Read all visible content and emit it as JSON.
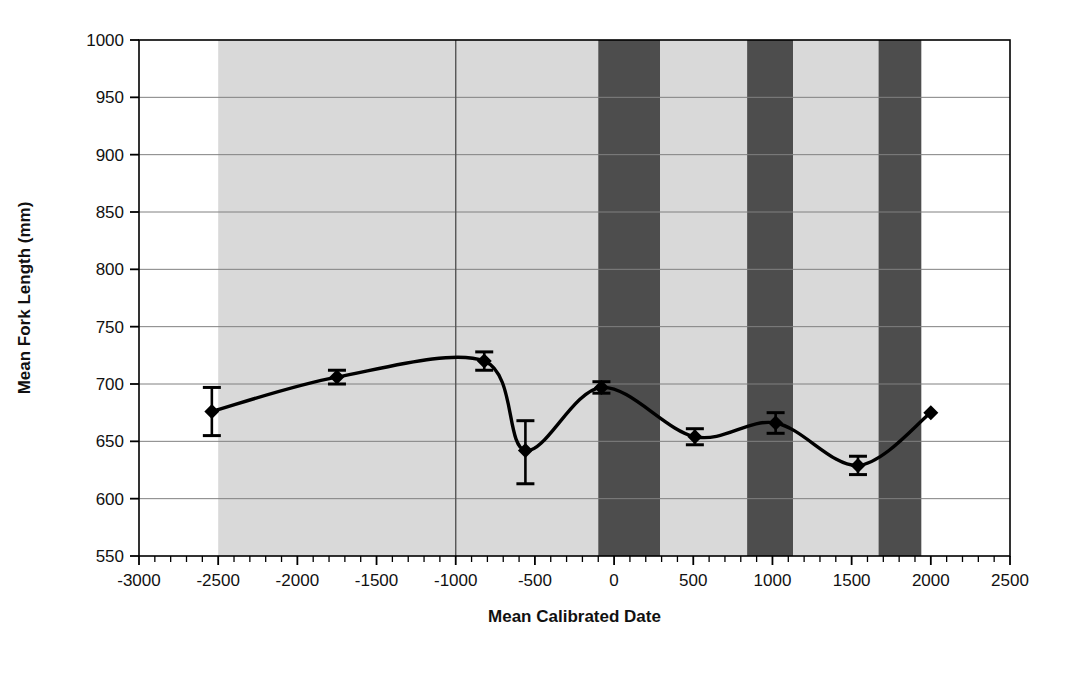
{
  "chart_data": {
    "type": "line",
    "title": "",
    "xlabel": "Mean Calibrated Date",
    "ylabel": "Mean Fork Length (mm)",
    "xlim": [
      -3000,
      2500
    ],
    "ylim": [
      550,
      1000
    ],
    "xticks": [
      -3000,
      -2500,
      -2000,
      -1500,
      -1000,
      -500,
      0,
      500,
      1000,
      1500,
      2000,
      2500
    ],
    "yticks": [
      550,
      600,
      650,
      700,
      750,
      800,
      850,
      900,
      950,
      1000
    ],
    "xtick_labels": [
      "-3000",
      "-2500",
      "-2000",
      "-1500",
      "-1000",
      "-500",
      "0",
      "500",
      "1000",
      "1500",
      "2000",
      "2500"
    ],
    "ytick_labels": [
      "550",
      "600",
      "650",
      "700",
      "750",
      "800",
      "850",
      "900",
      "950",
      "1000"
    ],
    "x_minor_tick_step": 100,
    "grid": "horizontal-major-and-one-vertical",
    "legend": "none",
    "series": [
      {
        "name": "Mean Fork Length",
        "marker": "diamond",
        "line_color": "#000000",
        "errorbars": true,
        "points": [
          {
            "x": -2540,
            "y": 676,
            "yerr_low": 655,
            "yerr_high": 697
          },
          {
            "x": -1750,
            "y": 706,
            "yerr_low": 700,
            "yerr_high": 712
          },
          {
            "x": -820,
            "y": 720,
            "yerr_low": 712,
            "yerr_high": 728
          },
          {
            "x": -560,
            "y": 642,
            "yerr_low": 613,
            "yerr_high": 668
          },
          {
            "x": -80,
            "y": 697,
            "yerr_low": 692,
            "yerr_high": 702
          },
          {
            "x": 510,
            "y": 654,
            "yerr_low": 647,
            "yerr_high": 661
          },
          {
            "x": 1020,
            "y": 666,
            "yerr_low": 657,
            "yerr_high": 675
          },
          {
            "x": 1540,
            "y": 629,
            "yerr_low": 621,
            "yerr_high": 637
          },
          {
            "x": 2000,
            "y": 675,
            "yerr_low": 675,
            "yerr_high": 675
          }
        ]
      }
    ],
    "shaded_bands": [
      {
        "x_start": -2500,
        "x_end": -1000,
        "color": "#d9d9d9",
        "shade": "light"
      },
      {
        "x_start": -1000,
        "x_end": -100,
        "color": "#d9d9d9",
        "shade": "light"
      },
      {
        "x_start": -100,
        "x_end": 290,
        "color": "#4d4d4d",
        "shade": "dark"
      },
      {
        "x_start": 290,
        "x_end": 840,
        "color": "#d9d9d9",
        "shade": "light"
      },
      {
        "x_start": 840,
        "x_end": 1130,
        "color": "#4d4d4d",
        "shade": "dark"
      },
      {
        "x_start": 1130,
        "x_end": 1670,
        "color": "#d9d9d9",
        "shade": "light"
      },
      {
        "x_start": 1670,
        "x_end": 1940,
        "color": "#4d4d4d",
        "shade": "dark"
      }
    ],
    "vertical_gridlines": [
      -1000
    ],
    "colors": {
      "band_light": "#d9d9d9",
      "band_dark": "#4d4d4d",
      "axis": "#000000",
      "grid": "#808080",
      "series": "#000000",
      "background": "#ffffff"
    }
  }
}
